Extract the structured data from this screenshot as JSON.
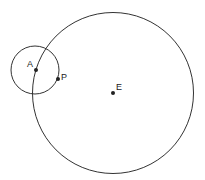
{
  "diagram": {
    "points": [
      {
        "id": "A",
        "label": "A"
      },
      {
        "id": "P",
        "label": "P"
      },
      {
        "id": "E",
        "label": "E"
      }
    ],
    "circles": [
      {
        "id": "large",
        "center": "E"
      },
      {
        "id": "small",
        "center": "A"
      }
    ],
    "stroke_color": "#333333",
    "point_color": "#222222"
  }
}
